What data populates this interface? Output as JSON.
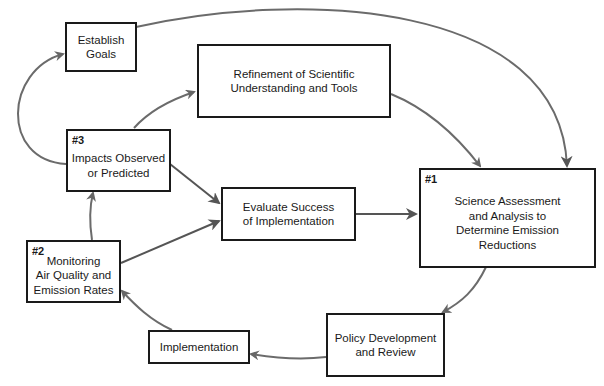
{
  "diagram": {
    "type": "flowchart-cycle",
    "nodes": [
      {
        "id": "goals",
        "number": "",
        "label": "Establish\nGoals"
      },
      {
        "id": "refinement",
        "number": "",
        "label": "Refinement of  Scientific\nUnderstanding and Tools"
      },
      {
        "id": "impacts",
        "number": "#3",
        "label": "Impacts Observed\nor Predicted"
      },
      {
        "id": "evaluate",
        "number": "",
        "label": "Evaluate Success\nof Implementation"
      },
      {
        "id": "science",
        "number": "#1",
        "label": "Science Assessment\nand Analysis to\nDetermine Emission\nReductions"
      },
      {
        "id": "monitoring",
        "number": "#2",
        "label": "Monitoring\nAir Quality and\nEmission Rates"
      },
      {
        "id": "implementation",
        "number": "",
        "label": "Implementation"
      },
      {
        "id": "policy",
        "number": "",
        "label": "Policy Development\nand Review"
      }
    ],
    "edges": [
      {
        "from": "goals",
        "to": "science"
      },
      {
        "from": "impacts",
        "to": "goals"
      },
      {
        "from": "impacts",
        "to": "refinement"
      },
      {
        "from": "refinement",
        "to": "science"
      },
      {
        "from": "impacts",
        "to": "evaluate"
      },
      {
        "from": "monitoring",
        "to": "evaluate"
      },
      {
        "from": "monitoring",
        "to": "impacts"
      },
      {
        "from": "evaluate",
        "to": "science"
      },
      {
        "from": "science",
        "to": "policy"
      },
      {
        "from": "policy",
        "to": "implementation"
      },
      {
        "from": "implementation",
        "to": "monitoring"
      }
    ],
    "colors": {
      "box_border": "#1a1a1a",
      "arrow": "#6b6b6b",
      "dark_arrow": "#555555"
    }
  }
}
